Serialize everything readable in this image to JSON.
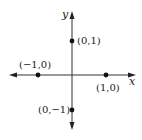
{
  "diagram": {
    "type": "coordinate-plane",
    "axes": {
      "x_label": "x",
      "y_label": "y",
      "color": "#333333"
    },
    "points": [
      {
        "id": "top",
        "label": "(0,1)",
        "x": 0,
        "y": 1
      },
      {
        "id": "left",
        "label": "(−1,0)",
        "x": -1,
        "y": 0
      },
      {
        "id": "right",
        "label": "(1,0)",
        "x": 1,
        "y": 0
      },
      {
        "id": "bottom",
        "label": "(0,−1)",
        "x": 0,
        "y": -1
      }
    ],
    "point_color": "#111111"
  }
}
